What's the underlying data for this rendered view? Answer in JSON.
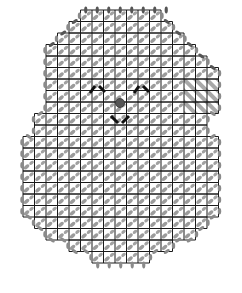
{
  "diagram": {
    "type": "plastic-canvas-stitch-chart",
    "grid": {
      "origin_x": 23,
      "origin_y": 10,
      "cell": 11.5,
      "cols": 17,
      "rows": 22
    },
    "colors": {
      "grid_line": "#1a1a1a",
      "stitch": "#8a8a8a",
      "edge_stitch": "#555555",
      "face_feature": "#111111",
      "nose": "#555555",
      "hatch": "#9a9a9a"
    },
    "rows": [
      {
        "r": 0,
        "from": 5,
        "to": 12,
        "edge": "top"
      },
      {
        "r": 1,
        "from": 4,
        "to": 13
      },
      {
        "r": 2,
        "from": 3,
        "to": 14
      },
      {
        "r": 3,
        "from": 2,
        "to": 15
      },
      {
        "r": 4,
        "from": 2,
        "to": 16
      },
      {
        "r": 5,
        "from": 2,
        "to": 17
      },
      {
        "r": 6,
        "from": 2,
        "to": 17
      },
      {
        "r": 7,
        "from": 2,
        "to": 17
      },
      {
        "r": 8,
        "from": 2,
        "to": 17
      },
      {
        "r": 9,
        "from": 1,
        "to": 16
      },
      {
        "r": 10,
        "from": 1,
        "to": 16
      },
      {
        "r": 11,
        "from": 0,
        "to": 17
      },
      {
        "r": 12,
        "from": 0,
        "to": 17
      },
      {
        "r": 13,
        "from": 0,
        "to": 17
      },
      {
        "r": 14,
        "from": 0,
        "to": 17
      },
      {
        "r": 15,
        "from": 0,
        "to": 17
      },
      {
        "r": 16,
        "from": 0,
        "to": 17
      },
      {
        "r": 17,
        "from": 0,
        "to": 17
      },
      {
        "r": 18,
        "from": 1,
        "to": 16
      },
      {
        "r": 19,
        "from": 2,
        "to": 15
      },
      {
        "r": 20,
        "from": 4,
        "to": 13
      },
      {
        "r": 21,
        "from": 6,
        "to": 11,
        "edge": "bottom"
      }
    ],
    "hatched_area": {
      "col_from": 14,
      "col_to": 17,
      "row_from": 6,
      "row_to": 9
    },
    "features": {
      "left_eye": {
        "label": "left-eye-caret",
        "cx": 98,
        "cy": 89
      },
      "right_eye": {
        "label": "right-eye-caret",
        "cx": 142,
        "cy": 89
      },
      "nose": {
        "label": "nose-dot",
        "cx": 120,
        "cy": 103
      },
      "mouth": {
        "label": "mouth-v",
        "cx": 121,
        "cy": 119
      }
    }
  }
}
